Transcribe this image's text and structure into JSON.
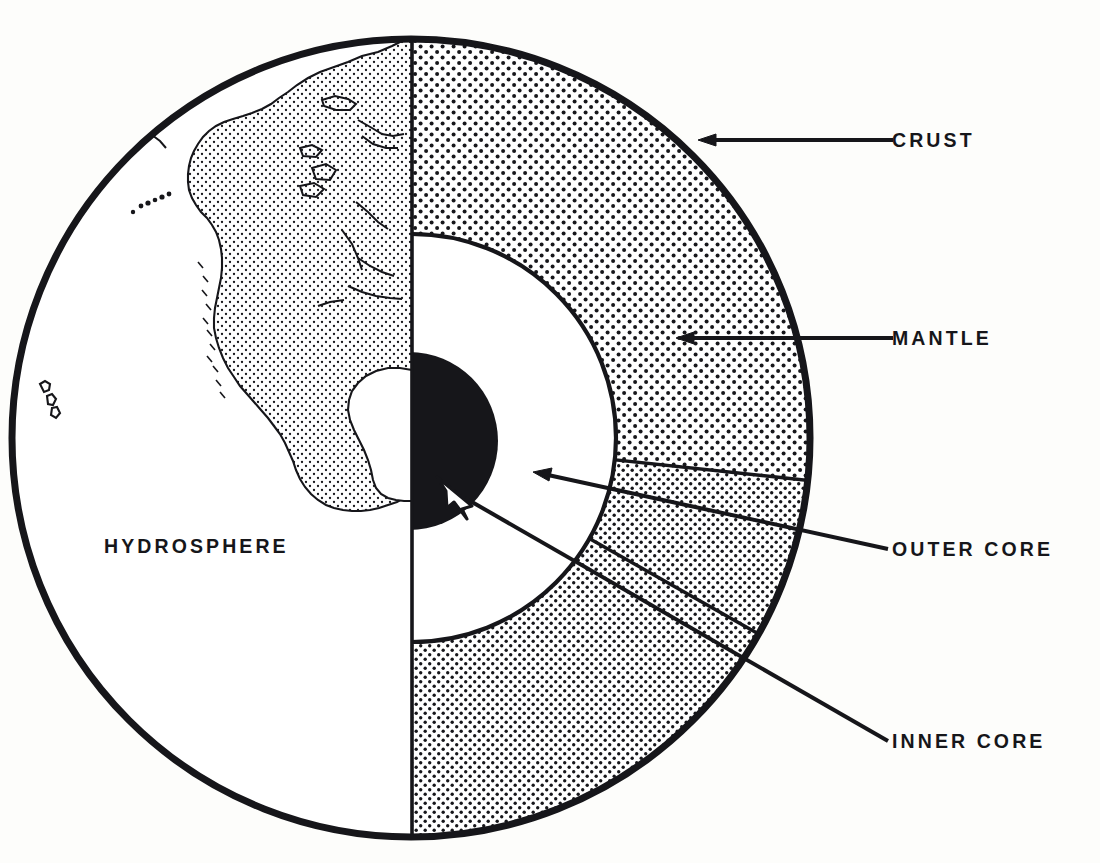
{
  "figure": {
    "kind": "earth-cross-section-diagram",
    "background_color": "#fdfdfb",
    "ink_color": "#16161a"
  },
  "labels": {
    "crust": "CRUST",
    "mantle": "MANTLE",
    "outer_core": "OUTER  CORE",
    "inner_core": "INNER  CORE",
    "hydrosphere": "HYDROSPHERE"
  },
  "layers": [
    {
      "name": "crust",
      "label": "CRUST",
      "fill": "outline-only",
      "outer_radius_px": 401,
      "leader_from": [
        893,
        140
      ],
      "leader_to": [
        700,
        140
      ]
    },
    {
      "name": "mantle",
      "label": "MANTLE",
      "fill": "coarse-stipple",
      "outer_radius_px": 398,
      "inner_radius_px": 204,
      "leader_from": [
        893,
        338
      ],
      "leader_to": [
        676,
        338
      ]
    },
    {
      "name": "outer_core",
      "label": "OUTER  CORE",
      "fill": "white",
      "outer_radius_px": 204,
      "inner_radius_px": 89,
      "leader_from": [
        888,
        549
      ],
      "leader_to": [
        533,
        472
      ]
    },
    {
      "name": "inner_core",
      "label": "INNER  CORE",
      "fill": "solid-black",
      "outer_radius_px": 89,
      "leader_from": [
        888,
        741
      ],
      "leader_to": [
        440,
        480
      ]
    },
    {
      "name": "hydrosphere",
      "label": "HYDROSPHERE",
      "fill": "white",
      "label_position": [
        104,
        553
      ]
    }
  ],
  "geometry": {
    "circle_center": [
      411,
      438
    ],
    "circle_radius": 401,
    "cut_axis_x": 412,
    "left_hemisphere": "surface-map-north-america",
    "right_hemisphere": "cutaway-interior"
  },
  "surface_features": {
    "landmass": "North America",
    "land_fill": "fine-stipple",
    "ocean_fill": "white",
    "islands": "Hawaiian Islands"
  }
}
